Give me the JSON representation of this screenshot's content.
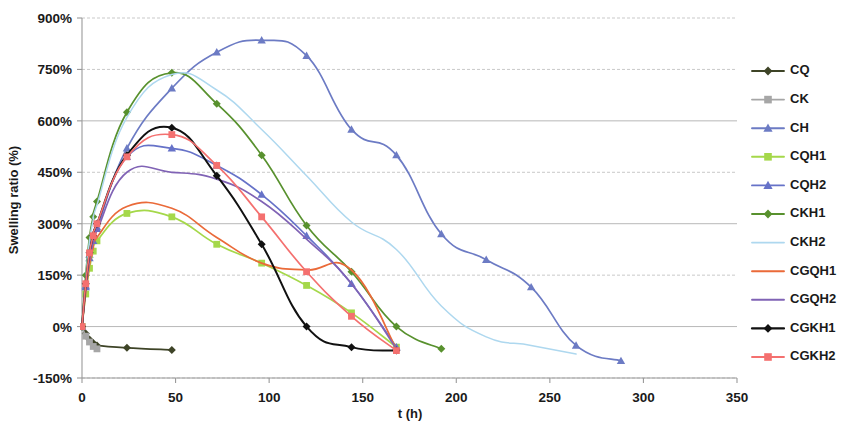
{
  "chart_data": {
    "type": "line",
    "title": "",
    "xlabel": "t (h)",
    "ylabel": "Swelling ratio (%)",
    "xlim": [
      0,
      350
    ],
    "ylim": [
      -150,
      900
    ],
    "xticks": [
      0,
      50,
      100,
      150,
      200,
      250,
      300,
      350
    ],
    "xtick_labels": [
      "0",
      "50",
      "100",
      "150",
      "200",
      "250",
      "300",
      "350"
    ],
    "yticks": [
      -150,
      0,
      150,
      300,
      450,
      600,
      750,
      900
    ],
    "ytick_labels": [
      "-150%",
      "0%",
      "150%",
      "300%",
      "450%",
      "600%",
      "750%",
      "900%"
    ],
    "grid": true,
    "legend_position": "right",
    "series": [
      {
        "name": "CQ",
        "color": "#3e4427",
        "marker": "diamond",
        "marker_color": "#3e4427",
        "x": [
          0,
          2,
          4,
          6,
          8,
          24,
          48
        ],
        "y": [
          0,
          -20,
          -38,
          -48,
          -55,
          -62,
          -68
        ]
      },
      {
        "name": "CK",
        "color": "#a6a6a6",
        "marker": "square",
        "marker_color": "#a6a6a6",
        "x": [
          0,
          2,
          4,
          6,
          8
        ],
        "y": [
          0,
          -28,
          -45,
          -58,
          -65
        ]
      },
      {
        "name": "CH",
        "color": "#6c7bc4",
        "marker": "triangle",
        "marker_color": "#6c7bc4",
        "x": [
          0,
          2,
          4,
          6,
          8,
          24,
          48,
          72,
          96,
          120,
          144,
          168,
          192,
          216,
          240,
          264,
          288
        ],
        "y": [
          0,
          120,
          210,
          255,
          290,
          520,
          695,
          800,
          835,
          790,
          575,
          500,
          270,
          195,
          115,
          -55,
          -100
        ]
      },
      {
        "name": "CQH1",
        "color": "#a5d84a",
        "marker": "square",
        "marker_color": "#a5d84a",
        "x": [
          0,
          2,
          4,
          6,
          8,
          24,
          48,
          72,
          96,
          120,
          144,
          168
        ],
        "y": [
          0,
          95,
          170,
          220,
          250,
          330,
          320,
          240,
          185,
          120,
          40,
          -60
        ]
      },
      {
        "name": "CQH2",
        "color": "#6672c8",
        "marker": "triangle",
        "marker_color": "#6672c8",
        "x": [
          0,
          2,
          4,
          6,
          8,
          24,
          48,
          72,
          96,
          120,
          144,
          168
        ],
        "y": [
          0,
          115,
          200,
          250,
          285,
          495,
          520,
          470,
          385,
          265,
          125,
          -60
        ]
      },
      {
        "name": "CKH1",
        "color": "#58912e",
        "marker": "diamond",
        "marker_color": "#58912e",
        "x": [
          0,
          2,
          4,
          6,
          8,
          24,
          48,
          72,
          96,
          120,
          144,
          168,
          192
        ],
        "y": [
          0,
          150,
          260,
          320,
          365,
          625,
          740,
          650,
          500,
          295,
          160,
          0,
          -65
        ]
      },
      {
        "name": "CKH2",
        "color": "#aed8ef",
        "marker": "none",
        "marker_color": "#aed8ef",
        "x": [
          0,
          2,
          4,
          6,
          8,
          24,
          48,
          72,
          96,
          120,
          144,
          168,
          192,
          216,
          240,
          264
        ],
        "y": [
          0,
          140,
          250,
          310,
          355,
          610,
          735,
          690,
          575,
          440,
          305,
          225,
          60,
          -30,
          -55,
          -80
        ]
      },
      {
        "name": "CGQH1",
        "color": "#ea6a39",
        "marker": "none",
        "marker_color": "#ea6a39",
        "x": [
          0,
          2,
          4,
          6,
          8,
          24,
          48,
          72,
          96,
          120,
          144,
          168
        ],
        "y": [
          0,
          100,
          180,
          230,
          260,
          350,
          345,
          260,
          185,
          165,
          165,
          -65
        ]
      },
      {
        "name": "CGQH2",
        "color": "#8063b5",
        "marker": "none",
        "marker_color": "#8063b5",
        "x": [
          0,
          2,
          4,
          6,
          8,
          24,
          48,
          72,
          96,
          120,
          144,
          168
        ],
        "y": [
          0,
          110,
          195,
          245,
          280,
          450,
          450,
          430,
          365,
          255,
          125,
          -65
        ]
      },
      {
        "name": "CGKH1",
        "color": "#111111",
        "marker": "diamond",
        "marker_color": "#111111",
        "x": [
          0,
          2,
          4,
          6,
          8,
          24,
          48,
          72,
          96,
          120,
          144,
          168
        ],
        "y": [
          0,
          125,
          215,
          265,
          300,
          500,
          580,
          440,
          240,
          0,
          -60,
          -70
        ]
      },
      {
        "name": "CGKH2",
        "color": "#f4706f",
        "marker": "square",
        "marker_color": "#f4706f",
        "x": [
          0,
          2,
          4,
          6,
          8,
          24,
          48,
          72,
          96,
          120,
          144,
          168
        ],
        "y": [
          0,
          125,
          215,
          265,
          300,
          495,
          560,
          470,
          320,
          160,
          30,
          -70
        ]
      }
    ]
  },
  "axes": {
    "ylabel": "Swelling ratio (%)",
    "xlabel": "t (h)"
  },
  "legend": {
    "items": [
      {
        "label": "CQ"
      },
      {
        "label": "CK"
      },
      {
        "label": "CH"
      },
      {
        "label": "CQH1"
      },
      {
        "label": "CQH2"
      },
      {
        "label": "CKH1"
      },
      {
        "label": "CKH2"
      },
      {
        "label": "CGQH1"
      },
      {
        "label": "CGQH2"
      },
      {
        "label": "CGKH1"
      },
      {
        "label": "CGKH2"
      }
    ]
  }
}
